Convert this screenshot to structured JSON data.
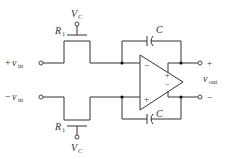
{
  "diagram": {
    "type": "circuit-schematic",
    "inputs": {
      "positive": {
        "sign": "+",
        "symbol": "v",
        "subscript": "in"
      },
      "negative": {
        "sign": "−",
        "symbol": "v",
        "subscript": "in"
      }
    },
    "output": {
      "symbol": "v",
      "subscript": "out",
      "plus_sign": "+",
      "minus_sign": "−"
    },
    "transistors": [
      {
        "id": "top",
        "resistor_label": "R",
        "resistor_sub": "1",
        "gate_label": "V",
        "gate_sub": "C"
      },
      {
        "id": "bottom",
        "resistor_label": "R",
        "resistor_sub": "1",
        "gate_label": "V",
        "gate_sub": "C"
      }
    ],
    "capacitors": [
      {
        "id": "top-feedback",
        "label": "C"
      },
      {
        "id": "bottom-feedback",
        "label": "C"
      }
    ],
    "opamp": {
      "input_minus": "−",
      "input_plus": "+",
      "output_plus": "+",
      "output_minus": "−"
    },
    "colors": {
      "line": "#333333",
      "background": "#ffffff"
    }
  }
}
